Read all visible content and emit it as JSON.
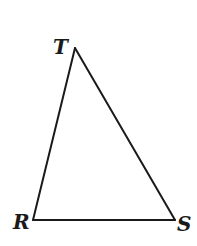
{
  "diagram": {
    "type": "triangle",
    "stroke_color": "#1a1a1a",
    "background": "#ffffff",
    "vertices": [
      {
        "name": "T",
        "x": 75,
        "y": 48
      },
      {
        "name": "R",
        "x": 33,
        "y": 220
      },
      {
        "name": "S",
        "x": 175,
        "y": 220
      }
    ],
    "labels": {
      "T": "T",
      "R": "R",
      "S": "S"
    },
    "sides": [
      "RT",
      "TS",
      "RS"
    ]
  }
}
